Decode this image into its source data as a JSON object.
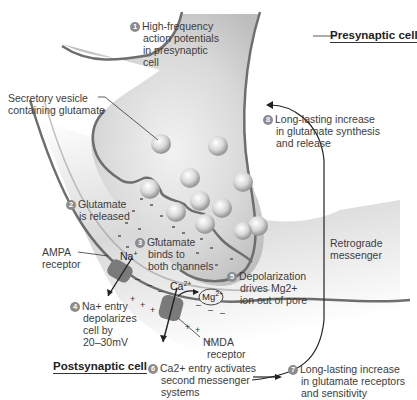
{
  "diagram": {
    "titles": {
      "presynaptic": "Presynaptic cell",
      "postsynaptic": "Postsynaptic cell"
    },
    "steps": [
      {
        "num": "1",
        "lines": [
          "High-frequency",
          "action potentials",
          "in presynaptic",
          "cell"
        ]
      },
      {
        "num": "2",
        "lines": [
          "Glutamate",
          "is released"
        ]
      },
      {
        "num": "3",
        "lines": [
          "Glutamate",
          "binds to",
          "both channels"
        ]
      },
      {
        "num": "4",
        "lines": [
          "Na+ entry",
          "depolarizes",
          "cell by",
          "20–30mV"
        ]
      },
      {
        "num": "5",
        "lines": [
          "Depolarization",
          "drives Mg2+",
          "ion out of pore"
        ]
      },
      {
        "num": "6",
        "lines": [
          "Ca2+ entry activates",
          "second messenger",
          "systems"
        ]
      },
      {
        "num": "7",
        "lines": [
          "Long-lasting increase",
          "in glutamate receptors",
          "and sensitivity"
        ]
      },
      {
        "num": "8",
        "lines": [
          "Long-lasting increase",
          "in glutamate synthesis",
          "and release"
        ]
      }
    ],
    "labels": {
      "vesicle": [
        "Secretory vesicle",
        "containing glutamate"
      ],
      "ampa": [
        "AMPA",
        "receptor"
      ],
      "nmda": [
        "NMDA",
        "receptor"
      ],
      "retrograde": [
        "Retrograde",
        "messenger"
      ]
    },
    "ions": {
      "na": "Na+",
      "ca": "Ca2+",
      "mg": "Mg2+"
    },
    "colors": {
      "membrane": "#6e6e6e",
      "cytoplasm": "#d4d4d4",
      "cleft": "#e6e6e6",
      "number_badge": "#8c8c8c",
      "text": "#3c3c3c"
    }
  }
}
